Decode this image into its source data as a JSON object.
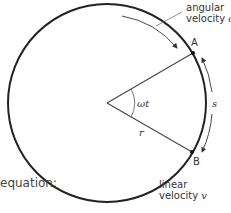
{
  "diagram": {
    "labels": {
      "angular_line1": "angular",
      "angular_line2": "velocity",
      "angular_symbol": "ω",
      "point_a": "A",
      "point_b": "B",
      "angle": "ωt",
      "arc": "s",
      "radius": "r",
      "linear_line1": "linear",
      "linear_line2": "velocity",
      "linear_symbol": "v",
      "equation": "equation:"
    },
    "colors": {
      "circle": "#222222",
      "lines": "#444444",
      "text": "#333333"
    }
  }
}
